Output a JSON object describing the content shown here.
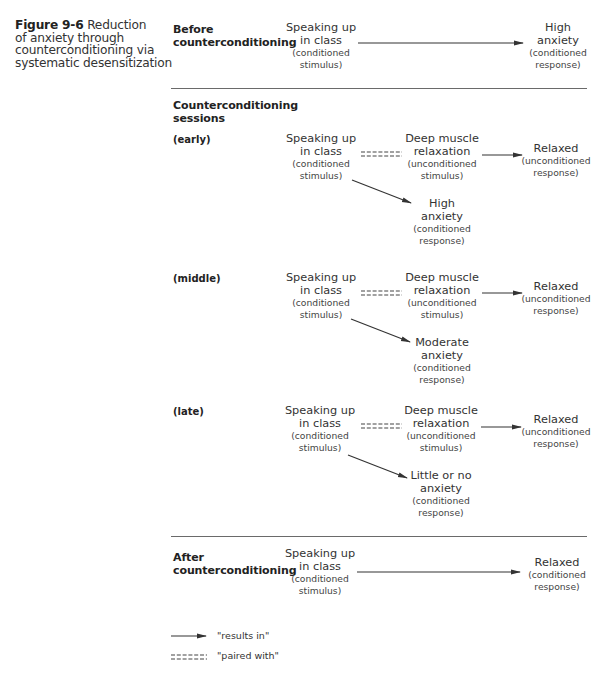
{
  "caption": {
    "figure_label": "Figure 9-6",
    "text_line1": "Reduction",
    "text_lines": [
      "of anxiety through",
      "counterconditioning via",
      "systematic desensitization"
    ]
  },
  "sections": {
    "before": {
      "label_lines": [
        "Before",
        "counterconditioning"
      ],
      "stimulus": {
        "main": [
          "Speaking up",
          "in class"
        ],
        "note": [
          "(conditioned",
          "stimulus)"
        ]
      },
      "response": {
        "main": [
          "High",
          "anxiety"
        ],
        "note": [
          "(conditioned",
          "response)"
        ]
      }
    },
    "sessions": {
      "label_lines": [
        "Counterconditioning",
        "sessions"
      ],
      "stages": [
        {
          "label": "(early)",
          "stimulus": {
            "main": [
              "Speaking up",
              "in class"
            ],
            "note": [
              "(conditioned",
              "stimulus)"
            ]
          },
          "paired": {
            "main": [
              "Deep muscle",
              "relaxation"
            ],
            "note": [
              "(unconditioned",
              "stimulus)"
            ]
          },
          "relaxed": {
            "main": [
              "Relaxed"
            ],
            "note": [
              "(unconditioned",
              "response)"
            ]
          },
          "anxiety": {
            "main": [
              "High",
              "anxiety"
            ],
            "note": [
              "(conditioned",
              "response)"
            ]
          }
        },
        {
          "label": "(middle)",
          "stimulus": {
            "main": [
              "Speaking up",
              "in class"
            ],
            "note": [
              "(conditioned",
              "stimulus)"
            ]
          },
          "paired": {
            "main": [
              "Deep muscle",
              "relaxation"
            ],
            "note": [
              "(unconditioned",
              "stimulus)"
            ]
          },
          "relaxed": {
            "main": [
              "Relaxed"
            ],
            "note": [
              "(unconditioned",
              "response)"
            ]
          },
          "anxiety": {
            "main": [
              "Moderate",
              "anxiety"
            ],
            "note": [
              "(conditioned",
              "response)"
            ]
          }
        },
        {
          "label": "(late)",
          "stimulus": {
            "main": [
              "Speaking up",
              "in class"
            ],
            "note": [
              "(conditioned",
              "stimulus)"
            ]
          },
          "paired": {
            "main": [
              "Deep muscle",
              "relaxation"
            ],
            "note": [
              "(unconditioned",
              "stimulus)"
            ]
          },
          "relaxed": {
            "main": [
              "Relaxed"
            ],
            "note": [
              "(unconditioned",
              "response)"
            ]
          },
          "anxiety": {
            "main": [
              "Little or no",
              "anxiety"
            ],
            "note": [
              "(conditioned",
              "response)"
            ]
          }
        }
      ]
    },
    "after": {
      "label_lines": [
        "After",
        "counterconditioning"
      ],
      "stimulus": {
        "main": [
          "Speaking up",
          "in class"
        ],
        "note": [
          "(conditioned",
          "stimulus)"
        ]
      },
      "response": {
        "main": [
          "Relaxed"
        ],
        "note": [
          "(conditioned",
          "response)"
        ]
      }
    }
  },
  "legend": {
    "results_in": "\"results in\"",
    "paired_with": "\"paired with\""
  },
  "colors": {
    "line": "#333333",
    "rule": "#6a6a6a",
    "text": "#2b2b2b"
  }
}
